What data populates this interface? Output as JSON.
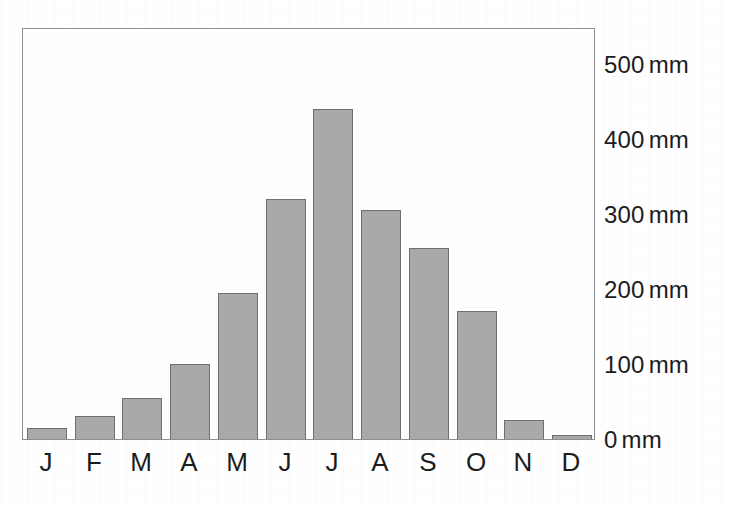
{
  "chart_data": {
    "type": "bar",
    "title": "",
    "subtitle": "",
    "xlabel": "",
    "ylabel": "",
    "categories": [
      "J",
      "F",
      "M",
      "A",
      "M",
      "J",
      "J",
      "A",
      "S",
      "O",
      "N",
      "D"
    ],
    "category_full_names": [
      "January",
      "February",
      "March",
      "April",
      "May",
      "June",
      "July",
      "August",
      "September",
      "October",
      "November",
      "December"
    ],
    "values": [
      15,
      30,
      55,
      100,
      195,
      320,
      440,
      305,
      255,
      170,
      25,
      5
    ],
    "unit": "mm",
    "ylim": [
      0,
      560
    ],
    "yticks": [
      0,
      100,
      200,
      300,
      400,
      500
    ],
    "ytick_labels": [
      "0 mm",
      "100 mm",
      "200 mm",
      "300 mm",
      "400 mm",
      "500 mm"
    ],
    "ytick_numbers": [
      "0",
      "100",
      "200",
      "300",
      "400",
      "500"
    ],
    "ytick_unit": "mm",
    "ytick_position": "right",
    "grid": false,
    "legend": null,
    "bar_color": "#a9a9a9",
    "bar_border_color": "#6f6f6f",
    "frame_color": "#8e8e8e",
    "background_color": "#ffffff",
    "text_color": "#1c1c1c"
  },
  "axis": {
    "y_ticks": [
      {
        "value": 500,
        "number": "500",
        "unit": "mm"
      },
      {
        "value": 400,
        "number": "400",
        "unit": "mm"
      },
      {
        "value": 300,
        "number": "300",
        "unit": "mm"
      },
      {
        "value": 200,
        "number": "200",
        "unit": "mm"
      },
      {
        "value": 100,
        "number": "100",
        "unit": "mm"
      },
      {
        "value": 0,
        "number": "0",
        "unit": "mm"
      }
    ],
    "x_ticks": [
      {
        "label": "J",
        "value": 15
      },
      {
        "label": "F",
        "value": 30
      },
      {
        "label": "M",
        "value": 55
      },
      {
        "label": "A",
        "value": 100
      },
      {
        "label": "M",
        "value": 195
      },
      {
        "label": "J",
        "value": 320
      },
      {
        "label": "J",
        "value": 440
      },
      {
        "label": "A",
        "value": 305
      },
      {
        "label": "S",
        "value": 255
      },
      {
        "label": "O",
        "value": 170
      },
      {
        "label": "N",
        "value": 25
      },
      {
        "label": "D",
        "value": 5
      }
    ]
  }
}
